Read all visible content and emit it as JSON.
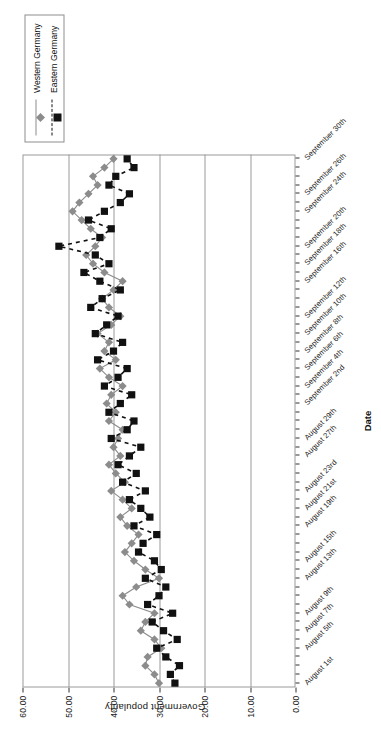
{
  "chart_data": {
    "type": "line",
    "title": "",
    "xlabel": "Date",
    "ylabel": "Government popularity",
    "ylim": [
      0,
      60
    ],
    "ytick_labels": [
      "0.00",
      "10.00",
      "20.00",
      "30.00",
      "40.00",
      "50.00",
      "60.00"
    ],
    "ytick_values": [
      0,
      10,
      20,
      30,
      40,
      50,
      60
    ],
    "grid": "vertical-gridlines-at-y-ticks",
    "legend_position": "top-right",
    "orientation": "rotated-90-ccw",
    "x": [
      "August 1st",
      "August 2nd",
      "August 3rd",
      "August 4th",
      "August 5th",
      "August 6th",
      "August 7th",
      "August 8th",
      "August 9th",
      "August 10th",
      "August 11th",
      "August 12th",
      "August 13th",
      "August 14th",
      "August 15th",
      "August 16th",
      "August 17th",
      "August 18th",
      "August 19th",
      "August 20th",
      "August 21st",
      "August 22nd",
      "August 23rd",
      "August 24th",
      "August 25th",
      "August 26th",
      "August 27th",
      "August 28th",
      "August 29th",
      "August 30th",
      "August 31st",
      "September 1st",
      "September 2nd",
      "September 3rd",
      "September 4th",
      "September 5th",
      "September 6th",
      "September 7th",
      "September 8th",
      "September 9th",
      "September 10th",
      "September 11th",
      "September 12th",
      "September 13th",
      "September 14th",
      "September 15th",
      "September 16th",
      "September 17th",
      "September 18th",
      "September 19th",
      "September 20th",
      "September 21st",
      "September 22nd",
      "September 23rd",
      "September 24th",
      "September 25th",
      "September 26th",
      "September 27th",
      "September 28th",
      "September 29th",
      "September 30th"
    ],
    "xtick_labels": [
      "August 1st",
      "August 5th",
      "August 7th",
      "August 9th",
      "August 13th",
      "August 15th",
      "August 19th",
      "August 21st",
      "August 23rd",
      "August 27th",
      "August 29th",
      "September 2nd",
      "September 4th",
      "September 6th",
      "September 8th",
      "September 10th",
      "September 12th",
      "September 16th",
      "September 18th",
      "September 20th",
      "September 24th",
      "September 26th",
      "September 30th"
    ],
    "series": [
      {
        "name": "Western Germany",
        "color": "#8c8c8c",
        "marker": "diamond",
        "line_style": "solid",
        "values": [
          30.0,
          31.0,
          33.0,
          32.5,
          29.5,
          31.0,
          34.0,
          33.0,
          31.0,
          36.5,
          38.0,
          35.0,
          30.0,
          33.0,
          35.5,
          37.5,
          36.0,
          34.5,
          37.0,
          38.5,
          36.0,
          38.0,
          40.5,
          37.5,
          39.5,
          41.0,
          38.5,
          40.0,
          39.0,
          38.0,
          41.0,
          39.5,
          41.5,
          40.5,
          38.0,
          41.0,
          43.0,
          39.5,
          42.0,
          41.0,
          43.5,
          40.5,
          38.5,
          41.0,
          42.5,
          40.0,
          38.0,
          42.0,
          44.5,
          46.0,
          44.0,
          42.5,
          45.0,
          47.0,
          49.0,
          47.5,
          45.5,
          43.5,
          44.5,
          42.0,
          40.0
        ]
      },
      {
        "name": "Eastern Germany",
        "color": "#111111",
        "marker": "square",
        "line_style": "dashed",
        "values": [
          26.5,
          27.5,
          25.5,
          28.5,
          30.5,
          26.0,
          29.0,
          31.5,
          27.0,
          32.5,
          30.0,
          28.5,
          33.0,
          29.5,
          31.0,
          34.5,
          33.5,
          30.5,
          35.5,
          32.0,
          34.0,
          36.5,
          33.0,
          38.0,
          35.0,
          39.0,
          36.5,
          34.0,
          40.5,
          37.0,
          35.5,
          41.0,
          38.5,
          36.0,
          42.0,
          39.0,
          37.0,
          43.5,
          40.0,
          38.0,
          44.0,
          41.5,
          39.0,
          45.0,
          42.5,
          38.5,
          43.0,
          46.5,
          41.0,
          44.0,
          52.0,
          43.0,
          40.5,
          45.5,
          42.0,
          38.5,
          36.5,
          41.0,
          39.5,
          35.5,
          37.0
        ]
      }
    ]
  },
  "legend": {
    "items": [
      {
        "label": "Western Germany"
      },
      {
        "label": "Eastern Germany"
      }
    ]
  }
}
